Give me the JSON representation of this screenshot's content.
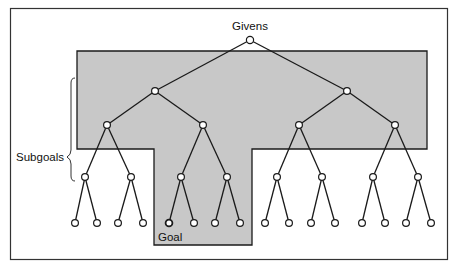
{
  "diagram": {
    "type": "search-tree",
    "labels": {
      "root": "Givens",
      "subgoals": "Subgoals",
      "goal": "Goal"
    },
    "colors": {
      "shaded_region": "#c8c8c8",
      "line": "#1a1a1a",
      "node_fill": "#ffffff",
      "frame": "#333333"
    },
    "levels": [
      {
        "depth": 0,
        "nodes": 1
      },
      {
        "depth": 1,
        "nodes": 2
      },
      {
        "depth": 2,
        "nodes": 4
      },
      {
        "depth": 3,
        "nodes": 8
      },
      {
        "depth": 4,
        "nodes": 16
      }
    ],
    "shaded_region_description": "T-shaped region covering depths 1-2 and the subtree leading to the Goal"
  }
}
